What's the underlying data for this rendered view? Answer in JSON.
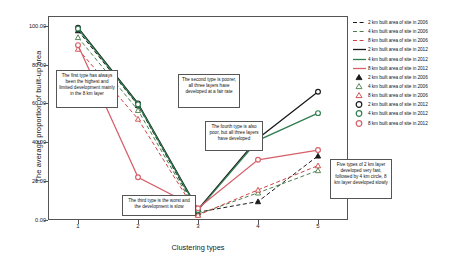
{
  "chart_data": {
    "type": "line",
    "title": "",
    "xlabel": "Clustering types",
    "ylabel": "The average proportion of built-up area",
    "categories": [
      "1",
      "2",
      "3",
      "4",
      "5"
    ],
    "xticklabels": [
      "1",
      "2",
      "3",
      "4",
      "5"
    ],
    "yticklabels": [
      "100.00",
      "80.00",
      "60.00",
      "40.00",
      "20.00",
      "0.00"
    ],
    "ytickvalues": [
      100,
      80,
      60,
      40,
      20,
      0
    ],
    "ylim": [
      0,
      105
    ],
    "xlim": [
      0.5,
      5.5
    ],
    "grid": false,
    "legend_position": "right-outside",
    "series": [
      {
        "name": "2 km built area of site in 2006",
        "year": "2006",
        "layer": "2 km",
        "style": "dashed",
        "color": "#1a1a1a",
        "marker": "triangle",
        "values": [
          97.5,
          59.0,
          4.0,
          9.5,
          33.0
        ]
      },
      {
        "name": "4 km built area of site in 2006",
        "year": "2006",
        "layer": "4 km",
        "style": "dashed",
        "color": "#4a7d4a",
        "marker": "triangle",
        "values": [
          94.0,
          56.5,
          3.0,
          14.0,
          25.5
        ]
      },
      {
        "name": "8 km built area of site in 2006",
        "year": "2006",
        "layer": "8 km",
        "style": "dashed",
        "color": "#cc4444",
        "marker": "triangle",
        "values": [
          88.0,
          52.0,
          2.5,
          15.5,
          28.0
        ]
      },
      {
        "name": "2 km built area of site in 2012",
        "year": "2012",
        "layer": "2 km",
        "style": "solid",
        "color": "#1a1a1a",
        "marker": "circle",
        "values": [
          99.0,
          60.0,
          5.5,
          42.0,
          66.0
        ]
      },
      {
        "name": "4 km built area of site in 2012",
        "year": "2012",
        "layer": "4 km",
        "style": "solid",
        "color": "#2e7d4f",
        "marker": "circle",
        "values": [
          98.5,
          59.5,
          5.0,
          41.0,
          55.0
        ]
      },
      {
        "name": "8 km built area of site in 2012",
        "year": "2012",
        "layer": "8 km",
        "style": "solid",
        "color": "#d6606a",
        "marker": "circle",
        "values": [
          90.0,
          22.0,
          6.0,
          31.0,
          36.0
        ]
      }
    ]
  },
  "legend": {
    "items": [
      {
        "label": "2 km built area of site in 2006",
        "kind": "dashed",
        "color": "#1a1a1a"
      },
      {
        "label": "4 km built area of site in 2006",
        "kind": "dashed",
        "color": "#4a7d4a"
      },
      {
        "label": "8 km built area of site in 2006",
        "kind": "dashed",
        "color": "#cc4444"
      },
      {
        "label": "2 km built area of site in 2012",
        "kind": "solid",
        "color": "#1a1a1a"
      },
      {
        "label": "4 km built area of site in 2012",
        "kind": "solid",
        "color": "#2e7d4f"
      },
      {
        "label": "8 km built area of site in 2012",
        "kind": "solid",
        "color": "#d6606a"
      },
      {
        "label": "2 km built area of site in 2006",
        "kind": "triangle",
        "color": "#1a1a1a"
      },
      {
        "label": "4 km built area of site in 2006",
        "kind": "triangle",
        "color": "#4a7d4a"
      },
      {
        "label": "8 km built area of site in 2006",
        "kind": "triangle",
        "color": "#cc4444"
      },
      {
        "label": "2 km built area of site in 2012",
        "kind": "circle",
        "color": "#1a1a1a"
      },
      {
        "label": "4 km built area of site in 2012",
        "kind": "circle",
        "color": "#2e7d4f"
      },
      {
        "label": "8 km built area of site in 2012",
        "kind": "circle",
        "color": "#d6606a"
      }
    ]
  },
  "annotations": [
    {
      "id": "anno-type-1",
      "text": "The first type has always been the highest and limited development mainly in the 8 km layer",
      "x": 56,
      "y": 70,
      "w": 62,
      "h": 38
    },
    {
      "id": "anno-type-2",
      "text": "The second type is poorer, all three layers have developed at a fair rate",
      "x": 178,
      "y": 74,
      "w": 62,
      "h": 34
    },
    {
      "id": "anno-type-4",
      "text": "The fourth type is also poor, but all three layers have developed",
      "x": 205,
      "y": 121,
      "w": 58,
      "h": 30
    },
    {
      "id": "anno-type-3",
      "text": "The third type is the worst and the development is slow",
      "x": 122,
      "y": 195,
      "w": 74,
      "h": 21
    },
    {
      "id": "anno-type-5",
      "text": "Five types of 2 km layer developed very fast, followed by 4 km circle, 8 km layer developed slowly",
      "x": 330,
      "y": 159,
      "w": 62,
      "h": 40
    }
  ]
}
